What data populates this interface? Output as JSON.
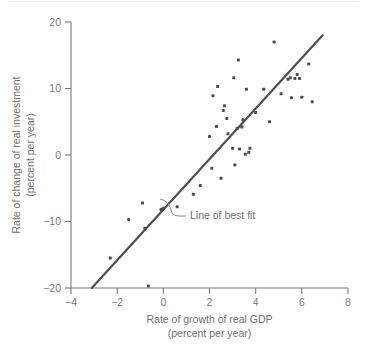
{
  "figure": {
    "background_color": "#ffffff",
    "ink_color": "#4d4d4d",
    "axis_color": "#7b7b7b",
    "annotation_label": "Line of best fit"
  },
  "chart_data": {
    "type": "scatter",
    "title": "",
    "xlabel": "Rate of growth of real GDP",
    "xlabel_sub": "(percent per year)",
    "ylabel": "Rate of change of real investment",
    "ylabel_sub": "(percent per year)",
    "xlim": [
      -4,
      8
    ],
    "ylim": [
      -20,
      20
    ],
    "xticks": [
      -4,
      -2,
      0,
      2,
      4,
      6,
      8
    ],
    "xtick_labels": [
      "−4",
      "−2",
      "0",
      "2",
      "4",
      "6",
      "8"
    ],
    "yticks": [
      -20,
      -10,
      0,
      10,
      20
    ],
    "ytick_labels": [
      "−20",
      "−10",
      "0",
      "10",
      "20"
    ],
    "grid": false,
    "legend": "none",
    "marker_size_px": 3,
    "points": [
      [
        -2.3,
        -15.5
      ],
      [
        -1.5,
        -9.7
      ],
      [
        -0.9,
        -7.2
      ],
      [
        -0.8,
        -11.0
      ],
      [
        -0.1,
        -8.2
      ],
      [
        -0.65,
        -19.7
      ],
      [
        0.0,
        -8.0
      ],
      [
        0.6,
        -7.8
      ],
      [
        1.3,
        -5.9
      ],
      [
        1.6,
        -4.6
      ],
      [
        2.0,
        2.8
      ],
      [
        2.1,
        -2.0
      ],
      [
        2.15,
        8.9
      ],
      [
        2.3,
        4.3
      ],
      [
        2.35,
        10.3
      ],
      [
        2.5,
        -3.5
      ],
      [
        2.6,
        6.7
      ],
      [
        2.65,
        7.4
      ],
      [
        2.75,
        5.5
      ],
      [
        2.8,
        3.2
      ],
      [
        3.0,
        1.0
      ],
      [
        3.05,
        11.6
      ],
      [
        3.1,
        -1.5
      ],
      [
        3.2,
        4.0
      ],
      [
        3.25,
        14.3
      ],
      [
        3.3,
        0.9
      ],
      [
        3.4,
        4.2
      ],
      [
        3.55,
        0.1
      ],
      [
        3.6,
        9.9
      ],
      [
        3.7,
        0.4
      ],
      [
        3.75,
        1.0
      ],
      [
        4.0,
        6.4
      ],
      [
        4.35,
        9.9
      ],
      [
        4.6,
        5.0
      ],
      [
        4.8,
        17.0
      ],
      [
        5.1,
        9.2
      ],
      [
        5.4,
        11.4
      ],
      [
        5.5,
        11.6
      ],
      [
        5.55,
        8.6
      ],
      [
        5.7,
        11.5
      ],
      [
        5.8,
        12.1
      ],
      [
        5.9,
        11.5
      ],
      [
        6.0,
        8.7
      ],
      [
        6.3,
        13.7
      ],
      [
        6.45,
        8.0
      ],
      [
        3.45,
        5.3
      ]
    ],
    "fit_line": {
      "label": "Line of best fit",
      "x0": -3.1,
      "y0": -20,
      "x1": 6.9,
      "y1": 18.0
    },
    "annotations": [
      {
        "text": "Line of best fit",
        "x": 1.3,
        "y": -9.6
      }
    ]
  }
}
